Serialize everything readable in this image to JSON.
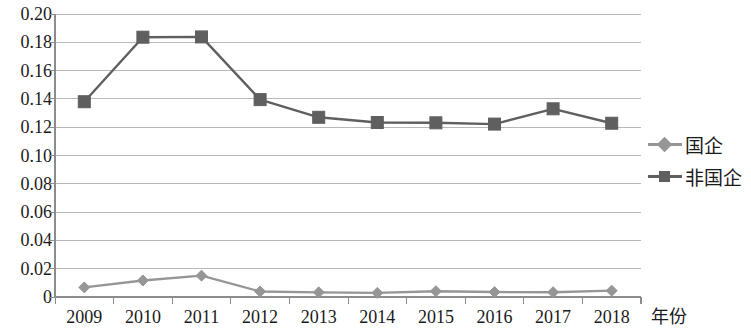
{
  "chart_data": {
    "type": "line",
    "title": "",
    "xlabel": "年份",
    "ylabel": "",
    "categories": [
      "2009",
      "2010",
      "2011",
      "2012",
      "2013",
      "2014",
      "2015",
      "2016",
      "2017",
      "2018"
    ],
    "ylim": [
      0,
      0.2
    ],
    "y_ticks": [
      "0",
      "0.02",
      "0.04",
      "0.06",
      "0.08",
      "0.10",
      "0.12",
      "0.14",
      "0.16",
      "0.18",
      "0.20"
    ],
    "y_tick_values": [
      0,
      0.02,
      0.04,
      0.06,
      0.08,
      0.1,
      0.12,
      0.14,
      0.16,
      0.18,
      0.2
    ],
    "grid": true,
    "legend_position": "right",
    "series": [
      {
        "name": "国企",
        "marker": "diamond",
        "color": "#969696",
        "values": [
          0.0068,
          0.0117,
          0.0151,
          0.0039,
          0.0033,
          0.0029,
          0.0041,
          0.0035,
          0.0034,
          0.0045
        ]
      },
      {
        "name": "非国企",
        "marker": "square",
        "color": "#5f5f5f",
        "values": [
          0.138,
          0.1836,
          0.1838,
          0.1395,
          0.127,
          0.1233,
          0.1231,
          0.1222,
          0.133,
          0.1228
        ]
      }
    ]
  },
  "axis": {
    "x_title": "年份"
  },
  "legend": {
    "items": [
      {
        "label": "国企"
      },
      {
        "label": "非国企"
      }
    ]
  },
  "colors": {
    "series_guoqi": "#969696",
    "series_feiguoqi": "#5f5f5f",
    "grid": "#b9b9b9",
    "axis": "#8c8c8c",
    "text": "#1a1a1a"
  }
}
